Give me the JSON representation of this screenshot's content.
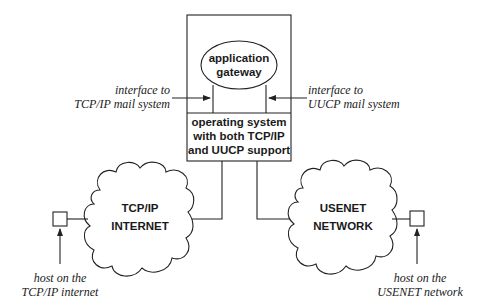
{
  "diagram": {
    "gateway_box": {
      "ellipse_label": [
        "application",
        "gateway"
      ],
      "os_label": [
        "operating system",
        "with both TCP/IP",
        "and UUCP support"
      ]
    },
    "left_interface": [
      "interface to",
      "TCP/IP mail system"
    ],
    "right_interface": [
      "interface to",
      "UUCP mail system"
    ],
    "left_cloud": [
      "TCP/IP",
      "INTERNET"
    ],
    "right_cloud": [
      "USENET",
      "NETWORK"
    ],
    "left_host": [
      "host on the",
      "TCP/IP internet"
    ],
    "right_host": [
      "host on the",
      "USENET network"
    ]
  }
}
